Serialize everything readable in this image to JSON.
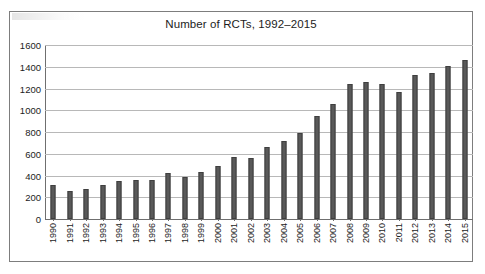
{
  "chart_data": {
    "type": "bar",
    "title": "Number of RCTs, 1992–2015",
    "xlabel": "",
    "ylabel": "",
    "ylim": [
      0,
      1600
    ],
    "yticks": [
      0,
      200,
      400,
      600,
      800,
      1000,
      1200,
      1400,
      1600
    ],
    "ytick_labels": [
      "0",
      "200",
      "400",
      "600",
      "800",
      "1000",
      "1200",
      "1400",
      "1600"
    ],
    "grid": true,
    "legend": false,
    "bar_color": "#595959",
    "bar_edge_color": "#3f3f3f",
    "gridline_color": "#b8b8b8",
    "axis_color": "#6f6f6f",
    "categories": [
      "1990",
      "1991",
      "1992",
      "1993",
      "1994",
      "1995",
      "1996",
      "1997",
      "1998",
      "1999",
      "2000",
      "2001",
      "2002",
      "2003",
      "2004",
      "2005",
      "2006",
      "2007",
      "2008",
      "2009",
      "2010",
      "2011",
      "2012",
      "2013",
      "2014",
      "2015"
    ],
    "values": [
      310,
      255,
      275,
      310,
      350,
      360,
      360,
      420,
      390,
      435,
      490,
      570,
      565,
      665,
      720,
      795,
      945,
      1055,
      1245,
      1260,
      1240,
      1165,
      1320,
      1345,
      1405,
      1460
    ]
  },
  "figure": {
    "border_color": "#7d7d7d",
    "background": "#ffffff"
  }
}
